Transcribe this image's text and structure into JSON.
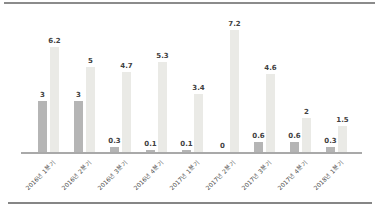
{
  "chart_data": {
    "type": "bar",
    "title": "",
    "xlabel": "",
    "ylabel": "",
    "categories": [
      "2016년 1분기",
      "2016년 2분기",
      "2016년 3분기",
      "2016년 4분기",
      "2017년 1분기",
      "2017년 2분기",
      "2017년 3분기",
      "2017년 4분기",
      "2018년 1분기"
    ],
    "series": [
      {
        "name": "bar-dark",
        "color": "#b5b5b5",
        "values": [
          3,
          3,
          0.3,
          0.1,
          0.1,
          0,
          0.6,
          0.6,
          0.3
        ]
      },
      {
        "name": "bar-light",
        "color": "#eaeae6",
        "values": [
          6.2,
          5,
          4.7,
          5.3,
          3.4,
          7.2,
          4.6,
          2,
          1.5
        ]
      }
    ],
    "value_labels": [
      "3",
      "6.2",
      "3",
      "5",
      "0.3",
      "4.7",
      "0.1",
      "5.3",
      "0.1",
      "3.4",
      "0",
      "7.2",
      "0.6",
      "4.6",
      "0.6",
      "2",
      "0.3",
      "1.5"
    ],
    "ylim": [
      0,
      7.5
    ],
    "grid": false,
    "legend": "none",
    "tick_label_rotation_deg": 45
  },
  "frame": {
    "top_rule_color": "#8b8b8b",
    "bottom_rule_color": "#868686",
    "axis_color": "#a9a9a9",
    "background": "#ffffff"
  }
}
